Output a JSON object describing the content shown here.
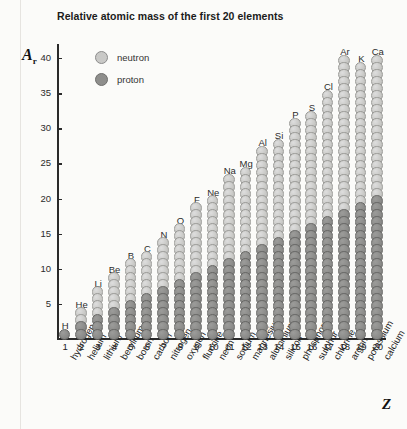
{
  "chart_data": {
    "type": "bar",
    "title": "Relative atomic mass of the first 20 elements",
    "xlabel": "Z",
    "ylabel": "A",
    "ylabel_sub": "r",
    "ylim": [
      0,
      42
    ],
    "yticks": [
      5,
      10,
      15,
      20,
      25,
      30,
      35,
      40
    ],
    "grid": false,
    "legend_position": "top-left-inside",
    "stacking": "proton (bottom, dark) + neutron (top, light)",
    "legend": [
      {
        "key": "neutron",
        "label": "neutron",
        "color": "#c9c9c7"
      },
      {
        "key": "proton",
        "label": "proton",
        "color": "#8e8e8c"
      }
    ],
    "categories": [
      1,
      2,
      3,
      4,
      5,
      6,
      7,
      8,
      9,
      10,
      11,
      12,
      13,
      14,
      15,
      16,
      17,
      18,
      19,
      20
    ],
    "element_names": [
      "hydrogen",
      "helium",
      "lithium",
      "beryllium",
      "boron",
      "carbon",
      "nitrogen",
      "oxygen",
      "fluorine",
      "neon",
      "sodium",
      "magnesium",
      "aluminium",
      "silicon",
      "phosphorus",
      "sulphur",
      "chlorine",
      "argon",
      "potassium",
      "calcium"
    ],
    "element_symbols": [
      "H",
      "He",
      "Li",
      "Be",
      "B",
      "C",
      "N",
      "O",
      "F",
      "Ne",
      "Na",
      "Mg",
      "Al",
      "Si",
      "P",
      "S",
      "Cl",
      "Ar",
      "K",
      "Ca"
    ],
    "series": [
      {
        "name": "proton",
        "values": [
          1,
          2,
          3,
          4,
          5,
          6,
          7,
          8,
          9,
          10,
          11,
          12,
          13,
          14,
          15,
          16,
          17,
          18,
          19,
          20
        ]
      },
      {
        "name": "neutron",
        "values": [
          0,
          2,
          4,
          5,
          6,
          6,
          7,
          8,
          10,
          10,
          12,
          12,
          14,
          14,
          16,
          16,
          18,
          22,
          20,
          20
        ]
      }
    ],
    "totals_relative_atomic_mass": [
      1,
      4,
      7,
      9,
      11,
      12,
      14,
      16,
      19,
      20,
      23,
      24,
      27,
      28,
      31,
      32,
      35,
      40,
      39,
      40
    ]
  }
}
